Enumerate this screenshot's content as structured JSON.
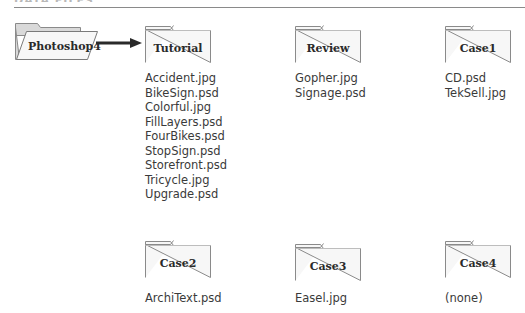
{
  "header": {
    "clipped_title": "DATA FILES"
  },
  "root_folder": {
    "name": "Photoshop4"
  },
  "folders": [
    {
      "name": "Tutorial",
      "files": [
        "Accident.jpg",
        "BikeSign.psd",
        "Colorful.jpg",
        "FillLayers.psd",
        "FourBikes.psd",
        "StopSign.psd",
        "Storefront.psd",
        "Tricycle.jpg",
        "Upgrade.psd"
      ]
    },
    {
      "name": "Review",
      "files": [
        "Gopher.jpg",
        "Signage.psd"
      ]
    },
    {
      "name": "Case1",
      "files": [
        "CD.psd",
        "TekSell.jpg"
      ]
    },
    {
      "name": "Case2",
      "files": [
        "ArchiText.psd"
      ]
    },
    {
      "name": "Case3",
      "files": [
        "Easel.jpg"
      ]
    },
    {
      "name": "Case4",
      "files": [
        "(none)"
      ]
    }
  ]
}
